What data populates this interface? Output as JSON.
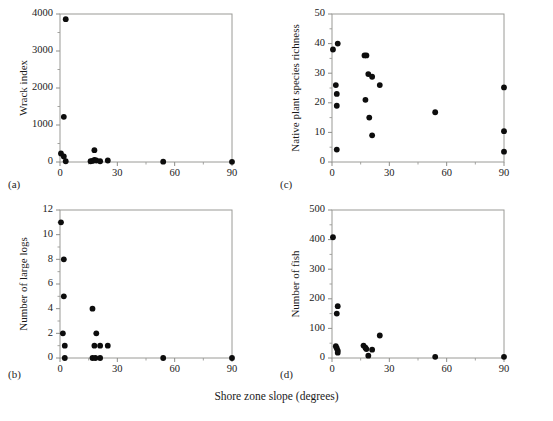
{
  "figure": {
    "shared_xlabel": "Shore zone slope (degrees)",
    "background": "#ffffff",
    "point_color": "#0d0d0d",
    "axis_color": "#9a9a96"
  },
  "chart_data": [
    {
      "type": "scatter",
      "panel": "a",
      "panel_label": "(a)",
      "title": "",
      "xlabel": "Shore zone slope (degrees)",
      "ylabel": "Wrack index",
      "xlim": [
        0,
        90
      ],
      "ylim": [
        0,
        4000
      ],
      "xticks": [
        0,
        30,
        60,
        90
      ],
      "yticks": [
        0,
        1000,
        2000,
        3000,
        4000
      ],
      "xminor": [
        15,
        45,
        75
      ],
      "yminor": [
        500,
        1500,
        2500,
        3500
      ],
      "grid": false,
      "legend": null,
      "points": [
        {
          "x": 3,
          "y": 3860
        },
        {
          "x": 2,
          "y": 1220
        },
        {
          "x": 0.5,
          "y": 230
        },
        {
          "x": 2,
          "y": 150
        },
        {
          "x": 3,
          "y": 20
        },
        {
          "x": 16,
          "y": 20
        },
        {
          "x": 17,
          "y": 30
        },
        {
          "x": 18,
          "y": 320
        },
        {
          "x": 18,
          "y": 60
        },
        {
          "x": 19,
          "y": 40
        },
        {
          "x": 21,
          "y": 20
        },
        {
          "x": 25,
          "y": 40
        },
        {
          "x": 54,
          "y": 10
        },
        {
          "x": 90,
          "y": 5
        }
      ]
    },
    {
      "type": "scatter",
      "panel": "b",
      "panel_label": "(b)",
      "title": "",
      "xlabel": "Shore zone slope (degrees)",
      "ylabel": "Number of large logs",
      "xlim": [
        0,
        90
      ],
      "ylim": [
        0,
        12
      ],
      "xticks": [
        0,
        30,
        60,
        90
      ],
      "yticks": [
        0,
        2,
        4,
        6,
        8,
        10,
        12
      ],
      "xminor": [
        15,
        45,
        75
      ],
      "yminor": [
        1,
        3,
        5,
        7,
        9,
        11
      ],
      "grid": false,
      "legend": null,
      "points": [
        {
          "x": 0.5,
          "y": 11
        },
        {
          "x": 2,
          "y": 8
        },
        {
          "x": 2,
          "y": 5
        },
        {
          "x": 1.5,
          "y": 2
        },
        {
          "x": 2.5,
          "y": 1
        },
        {
          "x": 2.5,
          "y": 0
        },
        {
          "x": 17,
          "y": 4
        },
        {
          "x": 19,
          "y": 2
        },
        {
          "x": 18,
          "y": 1
        },
        {
          "x": 21,
          "y": 1
        },
        {
          "x": 25,
          "y": 1
        },
        {
          "x": 17,
          "y": 0
        },
        {
          "x": 18.5,
          "y": 0
        },
        {
          "x": 21,
          "y": 0
        },
        {
          "x": 54,
          "y": 0
        },
        {
          "x": 90,
          "y": 0
        }
      ]
    },
    {
      "type": "scatter",
      "panel": "c",
      "panel_label": "(c)",
      "title": "",
      "xlabel": "Shore zone slope (degrees)",
      "ylabel": "Native plant species richness",
      "xlim": [
        0,
        90
      ],
      "ylim": [
        0,
        50
      ],
      "xticks": [
        0,
        30,
        60,
        90
      ],
      "yticks": [
        0,
        10,
        20,
        30,
        40,
        50
      ],
      "xminor": [
        15,
        45,
        75
      ],
      "yminor": [
        5,
        15,
        25,
        35,
        45
      ],
      "grid": false,
      "legend": null,
      "points": [
        {
          "x": 0.5,
          "y": 38
        },
        {
          "x": 3,
          "y": 40
        },
        {
          "x": 2,
          "y": 26
        },
        {
          "x": 2.5,
          "y": 23
        },
        {
          "x": 2.5,
          "y": 19
        },
        {
          "x": 2.5,
          "y": 4.2
        },
        {
          "x": 17,
          "y": 36
        },
        {
          "x": 18,
          "y": 36
        },
        {
          "x": 19,
          "y": 29.7
        },
        {
          "x": 21,
          "y": 28.8
        },
        {
          "x": 25,
          "y": 26
        },
        {
          "x": 17.5,
          "y": 21
        },
        {
          "x": 19.5,
          "y": 15
        },
        {
          "x": 21,
          "y": 9
        },
        {
          "x": 54,
          "y": 16.8
        },
        {
          "x": 90,
          "y": 25.2
        },
        {
          "x": 90,
          "y": 10.4
        },
        {
          "x": 90,
          "y": 3.5
        }
      ]
    },
    {
      "type": "scatter",
      "panel": "d",
      "panel_label": "(d)",
      "title": "",
      "xlabel": "Shore zone slope (degrees)",
      "ylabel": "Number of fish",
      "xlim": [
        0,
        90
      ],
      "ylim": [
        0,
        500
      ],
      "xticks": [
        0,
        30,
        60,
        90
      ],
      "yticks": [
        0,
        100,
        200,
        300,
        400,
        500
      ],
      "xminor": [
        15,
        45,
        75
      ],
      "yminor": [
        50,
        150,
        250,
        350,
        450
      ],
      "grid": false,
      "legend": null,
      "points": [
        {
          "x": 0.5,
          "y": 408
        },
        {
          "x": 3,
          "y": 175
        },
        {
          "x": 2.5,
          "y": 150
        },
        {
          "x": 2,
          "y": 40
        },
        {
          "x": 2.5,
          "y": 33
        },
        {
          "x": 3,
          "y": 25
        },
        {
          "x": 3,
          "y": 18
        },
        {
          "x": 16.5,
          "y": 42
        },
        {
          "x": 17.5,
          "y": 35
        },
        {
          "x": 18,
          "y": 30
        },
        {
          "x": 19,
          "y": 8
        },
        {
          "x": 21,
          "y": 28
        },
        {
          "x": 25,
          "y": 76
        },
        {
          "x": 54,
          "y": 4
        },
        {
          "x": 90,
          "y": 4
        }
      ]
    }
  ]
}
